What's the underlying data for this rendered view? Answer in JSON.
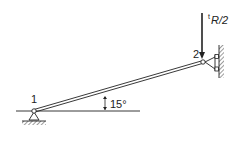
{
  "diagram": {
    "type": "truss-bar-structure",
    "nodes": [
      {
        "id": "1",
        "label": "1",
        "support": "pin"
      },
      {
        "id": "2",
        "label": "2",
        "support": "roller-on-vertical-wall"
      }
    ],
    "member": {
      "from": "1",
      "to": "2",
      "angle_label": "15°"
    },
    "load": {
      "node": "2",
      "direction": "down",
      "label_prefix": "t",
      "label_main": "R/2"
    },
    "colors": {
      "line": "#222222",
      "background": "#ffffff"
    }
  }
}
